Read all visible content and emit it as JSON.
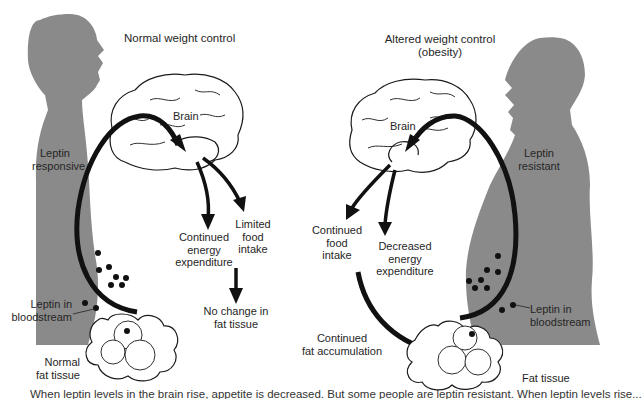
{
  "diagram": {
    "left_panel": {
      "title": "Normal weight control",
      "person_label_line1": "Leptin",
      "person_label_line2": "responsive",
      "brain_label": "Brain",
      "outcome_energy": [
        "Continued",
        "energy",
        "expenditure"
      ],
      "outcome_food": [
        "Limited",
        "food",
        "intake"
      ],
      "result": [
        "No change in",
        "fat tissue"
      ],
      "blood_label": [
        "Leptin in",
        "bloodstream"
      ],
      "fat_label": [
        "Normal",
        "fat tissue"
      ]
    },
    "right_panel": {
      "title_line1": "Altered weight control",
      "title_line2": "(obesity)",
      "person_label_line1": "Leptin",
      "person_label_line2": "resistant",
      "brain_label": "Brain",
      "outcome_food": [
        "Continued",
        "food",
        "intake"
      ],
      "outcome_energy": [
        "Decreased",
        "energy",
        "expenditure"
      ],
      "result": [
        "Continued",
        "fat accumulation"
      ],
      "blood_label": [
        "Leptin in",
        "bloodstream"
      ],
      "fat_label": "Fat tissue"
    },
    "caption": "When leptin levels in the brain rise, appetite is decreased. But some people are leptin resistant. When leptin levels rise..."
  },
  "colors": {
    "silhouette": "#8a8a8a",
    "arrow": "#111111",
    "line": "#1a1a1a"
  }
}
